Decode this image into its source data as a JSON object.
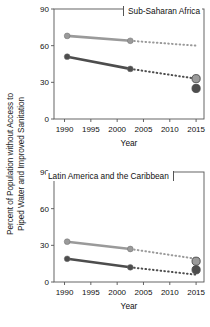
{
  "figure": {
    "ylabel_line1": "Percent of Population without Access to",
    "ylabel_line2": "Piped Water and Improved Sanitation",
    "xlabel": "Year",
    "colors": {
      "light_series": "#9a9a9a",
      "dark_series": "#4d4d4d",
      "axis": "#555555",
      "text": "#111111",
      "background": "#ffffff"
    }
  },
  "chart_data": [
    {
      "type": "line",
      "title": "Sub-Saharan Africa",
      "xlabel": "Year",
      "ylabel": "Percent of Population without Access to Piped Water and Improved Sanitation",
      "xlim": [
        1988,
        2016.5
      ],
      "ylim": [
        0,
        90
      ],
      "xticks": [
        1990,
        1995,
        2000,
        2005,
        2010,
        2015
      ],
      "xticklabels": [
        "1990",
        "1995",
        "2000",
        "2005",
        "2010",
        "2015"
      ],
      "yticks": [
        0,
        30,
        60,
        90
      ],
      "yticklabels": [
        "0",
        "30",
        "60",
        "90"
      ],
      "grid": false,
      "legend": "none",
      "series": [
        {
          "name": "Piped water (observed)",
          "color": "#9a9a9a",
          "style": "solid",
          "x": [
            1990.5,
            2002.5
          ],
          "values": [
            68,
            64
          ]
        },
        {
          "name": "Piped water (projected)",
          "color": "#9a9a9a",
          "style": "dotted",
          "x": [
            2002.5,
            2015
          ],
          "values": [
            64,
            60
          ]
        },
        {
          "name": "Improved sanitation (observed)",
          "color": "#4d4d4d",
          "style": "solid",
          "x": [
            1990.5,
            2002.5
          ],
          "values": [
            51,
            41
          ]
        },
        {
          "name": "Improved sanitation (projected)",
          "color": "#4d4d4d",
          "style": "dotted",
          "x": [
            2002.5,
            2015
          ],
          "values": [
            41,
            33
          ]
        }
      ],
      "endpoint_markers": [
        {
          "name": "2015 target piped water",
          "x": 2015,
          "value": 33,
          "color": "#9a9a9a"
        },
        {
          "name": "2015 target improved sanitation",
          "x": 2015,
          "value": 25,
          "color": "#4d4d4d"
        }
      ]
    },
    {
      "type": "line",
      "title": "Latin America and the Caribbean",
      "xlabel": "Year",
      "ylabel": "Percent of Population without Access to Piped Water and Improved Sanitation",
      "xlim": [
        1988,
        2016.5
      ],
      "ylim": [
        0,
        90
      ],
      "xticks": [
        1990,
        1995,
        2000,
        2005,
        2010,
        2015
      ],
      "xticklabels": [
        "1990",
        "1995",
        "2000",
        "2005",
        "2010",
        "2015"
      ],
      "yticks": [
        0,
        30,
        60,
        90
      ],
      "yticklabels": [
        "0",
        "30",
        "60",
        "90"
      ],
      "grid": false,
      "legend": "none",
      "series": [
        {
          "name": "Piped water (observed)",
          "color": "#9a9a9a",
          "style": "solid",
          "x": [
            1990.5,
            2002.5
          ],
          "values": [
            33,
            27
          ]
        },
        {
          "name": "Piped water (projected)",
          "color": "#9a9a9a",
          "style": "dotted",
          "x": [
            2002.5,
            2015
          ],
          "values": [
            27,
            19
          ]
        },
        {
          "name": "Improved sanitation (observed)",
          "color": "#4d4d4d",
          "style": "solid",
          "x": [
            1990.5,
            2002.5
          ],
          "values": [
            19,
            12
          ]
        },
        {
          "name": "Improved sanitation (projected)",
          "color": "#4d4d4d",
          "style": "dotted",
          "x": [
            2002.5,
            2015
          ],
          "values": [
            12,
            6
          ]
        }
      ],
      "endpoint_markers": [
        {
          "name": "2015 target piped water",
          "x": 2015,
          "value": 17,
          "color": "#9a9a9a"
        },
        {
          "name": "2015 target improved sanitation",
          "x": 2015,
          "value": 10,
          "color": "#4d4d4d"
        }
      ]
    }
  ]
}
